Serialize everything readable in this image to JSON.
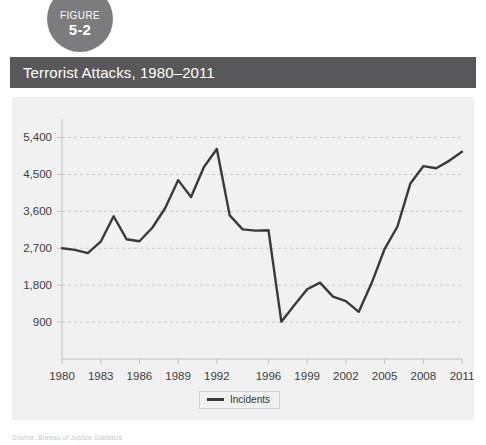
{
  "figure_badge": {
    "word": "FIGURE",
    "number": "5-2",
    "color": "#7c7c7e"
  },
  "title_bar": {
    "title": "Terrorist Attacks, 1980–2011",
    "background": "#58585a",
    "text_color": "#ffffff"
  },
  "source_note": {
    "text": "Source: Bureau of Justice Statistics"
  },
  "chart_data": {
    "type": "line",
    "title": "Terrorist Attacks, 1980–2011",
    "xlabel": "",
    "ylabel": "",
    "grid": true,
    "legend_position": "bottom",
    "line_color": "#3a3a3a",
    "plot_background": "#f1f1f1",
    "ylim": [
      0,
      5850
    ],
    "yticks": [
      900,
      1800,
      2700,
      3600,
      4500,
      5400
    ],
    "ytick_labels": [
      "900",
      "1,800",
      "2,700",
      "3,600",
      "4,500",
      "5,400"
    ],
    "xlim": [
      1980,
      2011
    ],
    "xticks": [
      1980,
      1983,
      1986,
      1989,
      1992,
      1996,
      1999,
      2002,
      2005,
      2008,
      2011
    ],
    "xtick_labels": [
      "1980",
      "1983",
      "1986",
      "1989",
      "1992",
      "1996",
      "1999",
      "2002",
      "2005",
      "2008",
      "2011"
    ],
    "series": [
      {
        "name": "Incidents",
        "x": [
          1980,
          1981,
          1982,
          1983,
          1984,
          1985,
          1986,
          1987,
          1988,
          1989,
          1990,
          1991,
          1992,
          1993,
          1994,
          1995,
          1996,
          1997,
          1998,
          1999,
          2000,
          2001,
          2002,
          2003,
          2004,
          2005,
          2006,
          2007,
          2008,
          2009,
          2010,
          2011
        ],
        "y": [
          2700,
          2660,
          2580,
          2860,
          3480,
          2920,
          2870,
          3200,
          3680,
          4360,
          3950,
          4680,
          5120,
          3500,
          3160,
          3130,
          3140,
          910,
          1310,
          1700,
          1860,
          1520,
          1410,
          1150,
          1850,
          2680,
          3230,
          4280,
          4700,
          4650,
          4830,
          5050
        ]
      }
    ]
  }
}
